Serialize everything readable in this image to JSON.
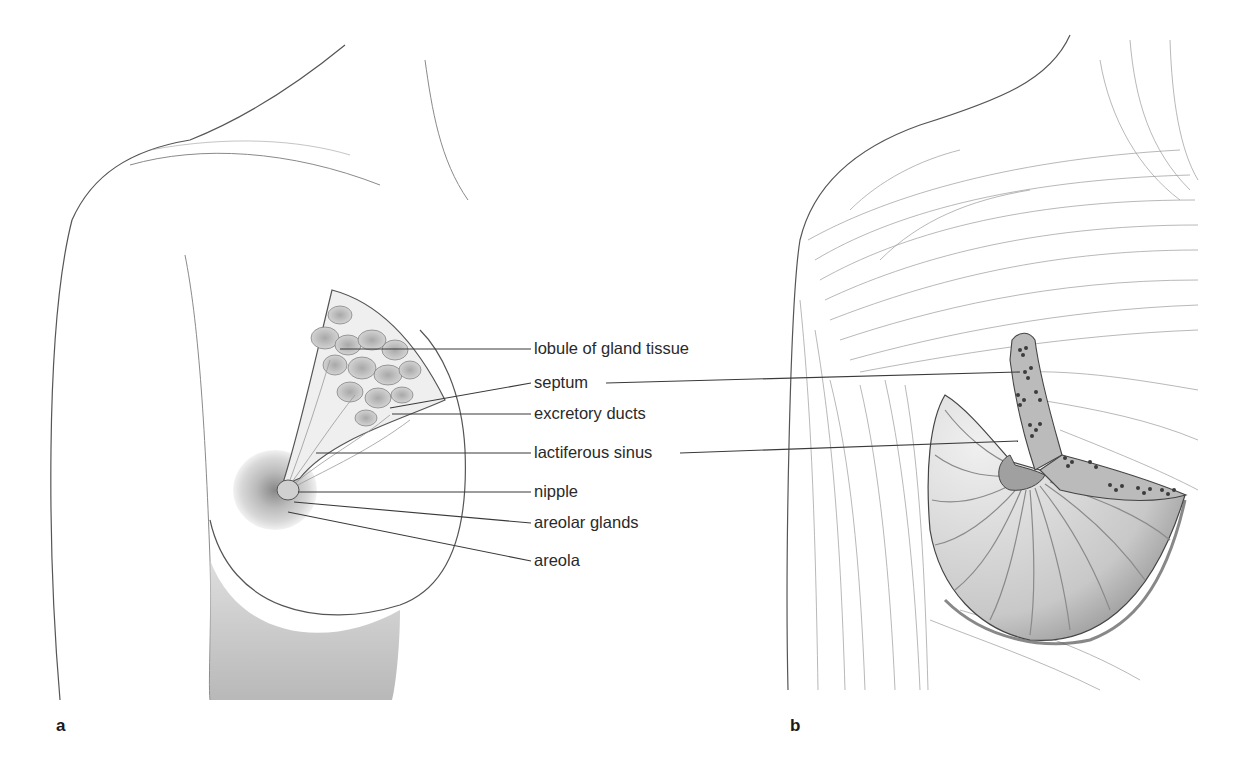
{
  "figure": {
    "panels": [
      {
        "id": "a",
        "letter": "a",
        "x": 56,
        "y": 731
      },
      {
        "id": "b",
        "letter": "b",
        "x": 790,
        "y": 731
      }
    ],
    "labels": [
      {
        "text": "lobule of gland tissue",
        "x": 534,
        "y": 354,
        "leaders": [
          {
            "x1": 340,
            "y1": 349,
            "x2": 531,
            "y2": 349
          }
        ]
      },
      {
        "text": "septum",
        "x": 534,
        "y": 388,
        "leaders": [
          {
            "x1": 390,
            "y1": 408,
            "x2": 531,
            "y2": 383
          },
          {
            "x1": 606,
            "y1": 383,
            "x2": 1020,
            "y2": 372
          }
        ]
      },
      {
        "text": "excretory ducts",
        "x": 534,
        "y": 419,
        "leaders": [
          {
            "x1": 392,
            "y1": 414,
            "x2": 531,
            "y2": 414
          }
        ]
      },
      {
        "text": "lactiferous sinus",
        "x": 534,
        "y": 458,
        "leaders": [
          {
            "x1": 316,
            "y1": 453,
            "x2": 531,
            "y2": 453
          },
          {
            "x1": 680,
            "y1": 453,
            "x2": 1018,
            "y2": 441
          }
        ]
      },
      {
        "text": "nipple",
        "x": 534,
        "y": 497,
        "leaders": [
          {
            "x1": 298,
            "y1": 492,
            "x2": 531,
            "y2": 492
          }
        ]
      },
      {
        "text": "areolar glands",
        "x": 534,
        "y": 528,
        "leaders": [
          {
            "x1": 294,
            "y1": 502,
            "x2": 531,
            "y2": 523
          }
        ]
      },
      {
        "text": "areola",
        "x": 534,
        "y": 566,
        "leaders": [
          {
            "x1": 288,
            "y1": 512,
            "x2": 531,
            "y2": 561
          }
        ]
      }
    ],
    "colors": {
      "background": "#ffffff",
      "ink": "#2a2a2a",
      "shade": "#bdbdbd",
      "dark_tissue": "#3c3c3c"
    }
  }
}
